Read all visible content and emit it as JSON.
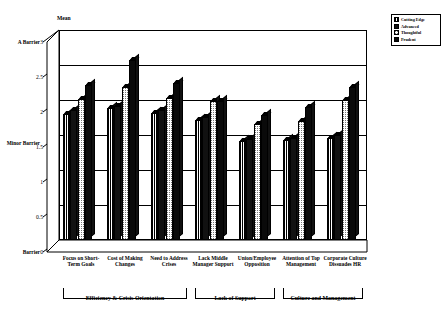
{
  "chart_data": {
    "type": "bar",
    "title": "",
    "ylabel": "Mean",
    "xlabel": "",
    "ylim": [
      0,
      3
    ],
    "yticks": [
      "0",
      "0.5",
      "1",
      "1.5",
      "2",
      "2.5",
      "3"
    ],
    "grid": true,
    "legend_position": "top-right",
    "anchor_labels": [
      {
        "value": "3",
        "text": "A Barrier"
      },
      {
        "value": "1.5",
        "text": "Minor Barrier"
      },
      {
        "value": "0",
        "text": "Barrier"
      }
    ],
    "categories": [
      "Focus on Short-Term Goals",
      "Cost of Making Changes",
      "Need to Address Crises",
      "Lack Middle Manager Support",
      "Union/Employee Opposition",
      "Attention of Top Management",
      "Corporate Culture Dissuades HR"
    ],
    "series": [
      {
        "name": "Cutting Edge",
        "values": [
          1.8,
          1.88,
          1.82,
          1.72,
          1.42,
          1.43,
          1.46
        ]
      },
      {
        "name": "Advanced",
        "values": [
          1.86,
          1.92,
          1.86,
          1.76,
          1.45,
          1.46,
          1.5
        ]
      },
      {
        "name": "Thoughtful",
        "values": [
          2.02,
          2.18,
          2.03,
          1.98,
          1.66,
          1.7,
          2.0
        ]
      },
      {
        "name": "Prudent",
        "values": [
          2.22,
          2.57,
          2.24,
          1.98,
          1.78,
          1.9,
          2.18
        ]
      }
    ],
    "groups": [
      {
        "label": "Efficiency & Crisis Orientation",
        "span": 3
      },
      {
        "label": "Lack of Support",
        "span": 2
      },
      {
        "label": "Culture and Management",
        "span": 2
      }
    ]
  },
  "legend": {
    "items": [
      {
        "label": "Cutting Edge"
      },
      {
        "label": "Advanced"
      },
      {
        "label": "Thoughtful"
      },
      {
        "label": "Prudent"
      }
    ]
  }
}
